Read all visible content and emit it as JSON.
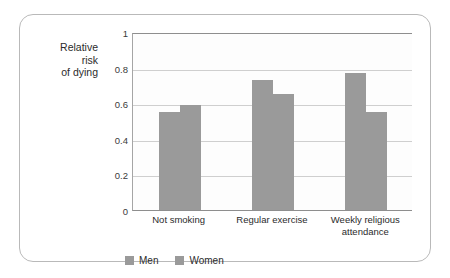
{
  "chart_data": {
    "type": "bar",
    "title": "",
    "xlabel": "",
    "ylabel": "Relative risk of dying",
    "ylabel_lines": [
      "Relative",
      "risk",
      "of dying"
    ],
    "categories": [
      "Not smoking",
      "Regular exercise",
      "Weekly religious attendance"
    ],
    "category_label_lines": [
      [
        "Not smoking"
      ],
      [
        "Regular exercise"
      ],
      [
        "Weekly religious",
        "attendance"
      ]
    ],
    "series": [
      {
        "name": "Men",
        "values": [
          0.55,
          0.73,
          0.77
        ]
      },
      {
        "name": "Women",
        "values": [
          0.59,
          0.65,
          0.55
        ]
      }
    ],
    "ylim": [
      0,
      1
    ],
    "ytick_values": [
      1,
      0.8,
      0.6,
      0.4,
      0.2,
      0
    ],
    "ytick_labels": [
      "1",
      "0.8",
      "0.6",
      "0.4",
      "0.2",
      "0"
    ],
    "grid": true,
    "legend_position": "bottom-left",
    "colors": {
      "bar": "#9a9a9a",
      "gridline": "#cfcfcf",
      "axis": "#8e8e8e",
      "plot_background": "#fdfdfd",
      "card_border": "#b9b9b9",
      "text": "#2b2b2b"
    }
  }
}
